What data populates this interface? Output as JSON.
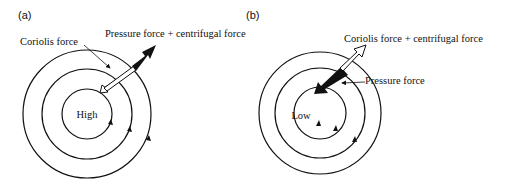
{
  "panels": [
    {
      "id": "a",
      "label": "(a)",
      "center_label": "High",
      "labels": {
        "coriolis": "Coriolis force",
        "pressure_centrifugal": "Pressure force + centrifugal force"
      }
    },
    {
      "id": "b",
      "label": "(b)",
      "center_label": "Low",
      "labels": {
        "coriolis_centrifugal": "Coriolis force + centrifugal force",
        "pressure": "Pressure force"
      }
    }
  ],
  "colors": {
    "stroke": "#111111",
    "background": "#ffffff"
  }
}
